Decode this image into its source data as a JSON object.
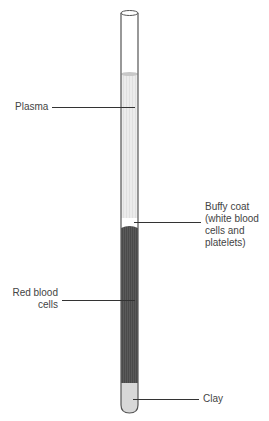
{
  "diagram": {
    "labels": {
      "plasma": "Plasma",
      "buffy_coat": "Buffy coat\n(white blood\ncells and\nplatelets)",
      "buffy_coat_lines": [
        "Buffy coat",
        "(white blood",
        "cells and",
        "platelets)"
      ],
      "red_blood_cells_lines": [
        "Red blood",
        "cells"
      ],
      "clay": "Clay"
    },
    "layers": [
      {
        "name": "Empty",
        "color": "#ffffff"
      },
      {
        "name": "Plasma",
        "color": "#e6e6e6"
      },
      {
        "name": "Buffy coat",
        "color": "#ffffff"
      },
      {
        "name": "Red blood cells",
        "color": "#555555"
      },
      {
        "name": "Clay",
        "color": "#d9d9d9"
      }
    ]
  }
}
